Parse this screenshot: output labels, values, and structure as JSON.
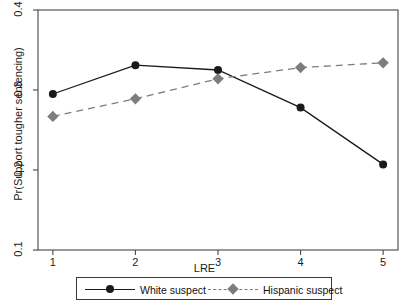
{
  "chart_data": {
    "type": "line",
    "title": "",
    "xlabel": "LRE",
    "ylabel": "Pr(Support tougher sentencing)",
    "x": [
      1,
      2,
      3,
      4,
      5
    ],
    "xticklabels": [
      "1",
      "2",
      "3",
      "4",
      "5"
    ],
    "yticklabels": [
      "0.1",
      "0.2",
      "0.3",
      "0.4"
    ],
    "yticks": [
      0.1,
      0.2,
      0.3,
      0.4
    ],
    "xlim": [
      0.82,
      5.18
    ],
    "ylim": [
      0.1,
      0.4
    ],
    "grid": false,
    "legend_position": "bottom",
    "series": [
      {
        "name": "White suspect",
        "values": [
          0.295,
          0.331,
          0.325,
          0.278,
          0.207
        ],
        "linestyle": "solid",
        "marker": "circle",
        "color": "#1a1a1a"
      },
      {
        "name": "Hispanic suspect",
        "values": [
          0.267,
          0.289,
          0.314,
          0.328,
          0.334
        ],
        "linestyle": "dashed",
        "marker": "diamond",
        "color": "#7d7d7d"
      }
    ]
  },
  "legend": {
    "entries": [
      {
        "label": "White suspect"
      },
      {
        "label": "Hispanic suspect"
      }
    ]
  },
  "axes": {
    "x_title": "LRE",
    "y_title": "Pr(Support tougher sentencing)"
  }
}
